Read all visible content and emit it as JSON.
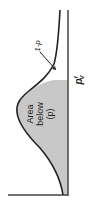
{
  "diagram": {
    "type": "probability-density-curve",
    "orientation": "rotated-90-ccw",
    "shaded_label_lines": [
      "Area",
      "below",
      "(p)"
    ],
    "tail_label": "1-p",
    "threshold_label": {
      "base": "p",
      "sup": "f",
      "sub": "V"
    },
    "colors": {
      "curve": "#222222",
      "shade": "#c8c8c8",
      "axis": "#444444"
    }
  }
}
